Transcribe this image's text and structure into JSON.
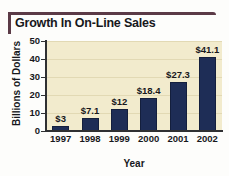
{
  "chart_data": {
    "type": "bar",
    "title": "Growth In On-Line Sales",
    "xlabel": "Year",
    "ylabel": "Billions of Dollars",
    "categories": [
      "1997",
      "1998",
      "1999",
      "2000",
      "2001",
      "2002"
    ],
    "values": [
      3,
      7.1,
      12,
      18.4,
      27.3,
      41.1
    ],
    "data_labels": [
      "$3",
      "$7.1",
      "$12",
      "$18.4",
      "$27.3",
      "$41.1"
    ],
    "ylim": [
      0,
      50
    ],
    "yticks": [
      0,
      10,
      20,
      30,
      40,
      50
    ],
    "ytick_labels": [
      "0",
      "10",
      "20",
      "30",
      "40",
      "50"
    ],
    "grid": true,
    "legend": "none",
    "colors": {
      "bar": "#1e2d56",
      "plot_background": "#f2ebcd",
      "axis": "#2f3032",
      "gridline": "#e2d9b4",
      "title_accent": "#5b3a46",
      "text": "#17181c"
    }
  }
}
